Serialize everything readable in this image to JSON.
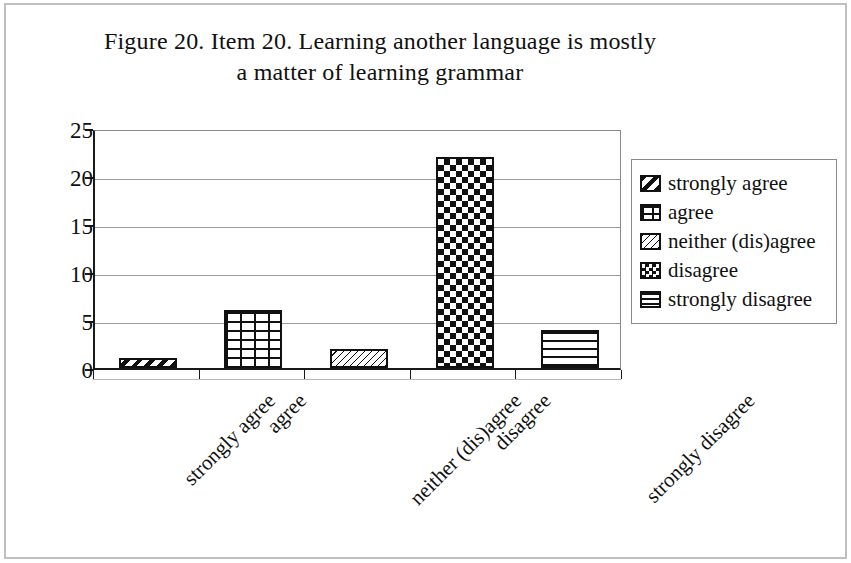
{
  "chart_data": {
    "type": "bar",
    "title": "Figure 20. Item 20. Learning another language is mostly a matter of learning grammar",
    "title_lines": [
      "Figure 20. Item 20. Learning another language is mostly",
      "a matter of learning grammar"
    ],
    "xlabel": "",
    "ylabel": "",
    "categories": [
      "strongly agree",
      "agree",
      "neither (dis)agree",
      "disagree",
      "strongly disagree"
    ],
    "values": [
      1,
      6,
      2,
      22,
      4
    ],
    "ylim": [
      0,
      25
    ],
    "yticks": [
      0,
      5,
      10,
      15,
      20,
      25
    ],
    "ytick_labels": [
      "0",
      "5",
      "10",
      "15",
      "20",
      "25"
    ],
    "grid": true,
    "grid_axis": "y",
    "legend_position": "right",
    "legend": [
      {
        "label": "strongly agree",
        "pattern": "diagonal-stripes-wide"
      },
      {
        "label": "agree",
        "pattern": "brick"
      },
      {
        "label": "neither (dis)agree",
        "pattern": "diagonal-hatch-thin"
      },
      {
        "label": "disagree",
        "pattern": "checkerboard"
      },
      {
        "label": "strongly disagree",
        "pattern": "horizontal-lines"
      }
    ],
    "series_colors": {
      "fill": "#ffffff",
      "outline": "#111111",
      "pattern": "#111111",
      "axis": "#1a1a1a",
      "gridline": "#9a9a9a",
      "frame": "#bfbfbf"
    },
    "xtick_label_rotation": -45
  }
}
